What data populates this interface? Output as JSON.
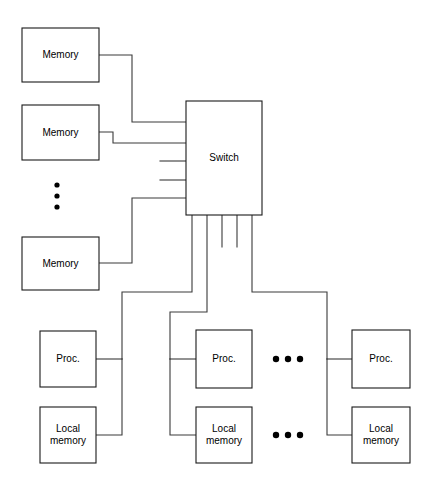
{
  "diagram": {
    "colors": {
      "background": "#ffffff",
      "box_stroke": "#1a1a1a",
      "wire_stroke": "#3a3a3a",
      "label_text": "#000000",
      "dot_fill": "#000000"
    },
    "nodes": [
      {
        "id": "memory-1",
        "label": "Memory",
        "x": 22,
        "y": 28,
        "w": 77,
        "h": 54
      },
      {
        "id": "memory-2",
        "label": "Memory",
        "x": 22,
        "y": 105,
        "w": 77,
        "h": 55
      },
      {
        "id": "memory-3",
        "label": "Memory",
        "x": 22,
        "y": 237,
        "w": 77,
        "h": 53
      },
      {
        "id": "switch",
        "label": "Switch",
        "x": 186,
        "y": 101,
        "w": 76,
        "h": 114
      },
      {
        "id": "proc-1",
        "label": "Proc.",
        "x": 40,
        "y": 331,
        "w": 56,
        "h": 56
      },
      {
        "id": "local-memory-1",
        "label": "Local\nmemory",
        "x": 40,
        "y": 407,
        "w": 56,
        "h": 56
      },
      {
        "id": "proc-2",
        "label": "Proc.",
        "x": 196,
        "y": 330,
        "w": 56,
        "h": 58
      },
      {
        "id": "local-memory-2",
        "label": "Local\nmemory",
        "x": 196,
        "y": 407,
        "w": 56,
        "h": 56
      },
      {
        "id": "proc-3",
        "label": "Proc.",
        "x": 352,
        "y": 330,
        "w": 58,
        "h": 58
      },
      {
        "id": "local-memory-3",
        "label": "Local\nmemory",
        "x": 352,
        "y": 407,
        "w": 58,
        "h": 56
      }
    ],
    "ellipses": [
      {
        "id": "vertical-ellipsis-memory",
        "orientation": "vertical",
        "cx": 57,
        "cy": 196,
        "count": 3,
        "spacing": 11,
        "r": 2.6
      },
      {
        "id": "horizontal-ellipsis-proc",
        "orientation": "horizontal",
        "cx": 288,
        "cy": 359,
        "count": 3,
        "spacing": 12,
        "r": 3.2
      },
      {
        "id": "horizontal-ellipsis-local",
        "orientation": "horizontal",
        "cx": 288,
        "cy": 435,
        "count": 3,
        "spacing": 12,
        "r": 3.2
      }
    ],
    "wires": [
      {
        "id": "wire-memory-1-to-switch",
        "points": "99,55 132,55 132,122 186,122"
      },
      {
        "id": "wire-memory-2-to-switch",
        "points": "99,132 113,132 113,143 186,143"
      },
      {
        "id": "wire-switch-port-3-stub",
        "points": "160,161 186,161"
      },
      {
        "id": "wire-switch-port-4-stub",
        "points": "160,180 186,180"
      },
      {
        "id": "wire-memory-3-to-switch",
        "points": "99,263 132,263 132,198 186,198"
      },
      {
        "id": "wire-switch-to-cluster-1",
        "points": "192,215 192,292 122,292 122,359"
      },
      {
        "id": "wire-cluster-1-proc-branch",
        "points": "122,359 96,359"
      },
      {
        "id": "wire-cluster-1-local-branch",
        "points": "122,359 122,435 96,435"
      },
      {
        "id": "wire-switch-to-cluster-2",
        "points": "207,215 207,312 170,312 170,359"
      },
      {
        "id": "wire-cluster-2-proc-branch",
        "points": "170,359 196,359"
      },
      {
        "id": "wire-cluster-2-local-branch",
        "points": "170,359 170,435 196,435"
      },
      {
        "id": "wire-switch-port-b3-stub",
        "points": "222,215 222,247"
      },
      {
        "id": "wire-switch-port-b4-stub",
        "points": "237,215 237,247"
      },
      {
        "id": "wire-switch-to-cluster-3",
        "points": "252,215 252,292 327,292 327,359"
      },
      {
        "id": "wire-cluster-3-proc-branch",
        "points": "327,359 352,359"
      },
      {
        "id": "wire-cluster-3-local-branch",
        "points": "327,359 327,435 352,435"
      }
    ]
  }
}
